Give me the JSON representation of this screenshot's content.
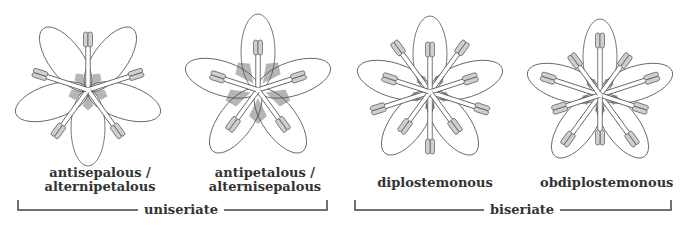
{
  "colors": {
    "outline": "#555555",
    "anther_fill": "#cfcfcf",
    "sepal_fill": "#b5b5b5",
    "text": "#333333",
    "bracket": "#444444"
  },
  "flowers": [
    {
      "id": "antisepalous",
      "label_line1": "antisepalous /",
      "label_line2": "alternipetalous",
      "cx": 88,
      "cy": 90,
      "petal_offset": 36,
      "stamen_whorls": [
        {
          "offset": 0,
          "len": 58
        }
      ],
      "show_sepals": true
    },
    {
      "id": "antipetalous",
      "label_line1": "antipetalous /",
      "label_line2": "alternisepalous",
      "cx": 258,
      "cy": 90,
      "petal_offset": 0,
      "stamen_whorls": [
        {
          "offset": 0,
          "len": 50
        }
      ],
      "show_sepals": true,
      "sepal_prominent": true
    },
    {
      "id": "diplostemonous",
      "label_line1": "diplostemonous",
      "label_line2": "",
      "cx": 430,
      "cy": 92,
      "petal_offset": 0,
      "stamen_whorls": [
        {
          "offset": 36,
          "len": 62
        },
        {
          "offset": 0,
          "len": 50
        }
      ],
      "show_sepals": true
    },
    {
      "id": "obdiplostemonous",
      "label_line1": "obdiplostemonous",
      "label_line2": "",
      "cx": 600,
      "cy": 95,
      "petal_offset": 0,
      "stamen_whorls": [
        {
          "offset": 0,
          "len": 62
        },
        {
          "offset": 36,
          "len": 50
        }
      ],
      "show_sepals": true
    }
  ],
  "groups": [
    {
      "label": "uniseriate",
      "x1": 18,
      "x2": 327,
      "y": 210
    },
    {
      "label": "biseriate",
      "x1": 355,
      "x2": 671,
      "y": 210
    }
  ]
}
